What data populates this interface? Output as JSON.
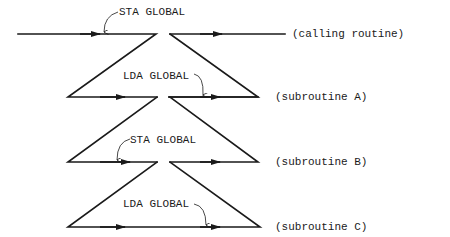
{
  "annotations": {
    "sta_top": "STA GLOBAL",
    "lda_a": "LDA GLOBAL",
    "sta_b": "STA GLOBAL",
    "lda_c": "LDA GLOBAL"
  },
  "levels": {
    "calling": "(calling routine)",
    "sub_a": "(subroutine A)",
    "sub_b": "(subroutine B)",
    "sub_c": "(subroutine C)"
  },
  "colors": {
    "line": "#1a1a1a",
    "background": "#ffffff"
  }
}
